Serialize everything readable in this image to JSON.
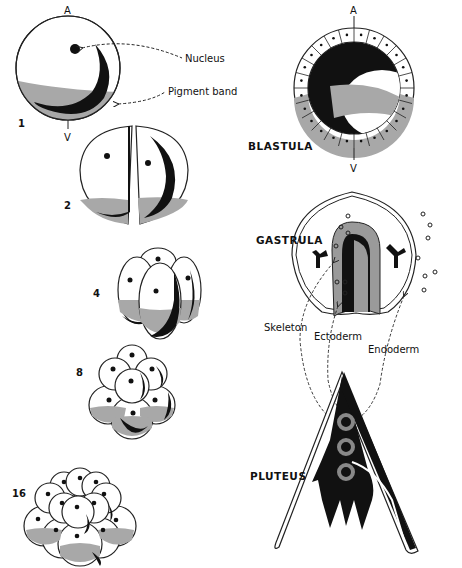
{
  "diagram": {
    "colors": {
      "pigment_gray": "#a8a8a8",
      "endoderm_gray": "#9a9a9a",
      "dark": "#111111",
      "outline": "#222222"
    },
    "cleavage_stages": [
      {
        "label": "1",
        "cells": 1
      },
      {
        "label": "2",
        "cells": 2
      },
      {
        "label": "4",
        "cells": 4
      },
      {
        "label": "8",
        "cells": 8
      },
      {
        "label": "16",
        "cells": 16
      }
    ],
    "pole_labels": {
      "animal": "A",
      "vegetal": "V"
    },
    "annotations": {
      "nucleus": "Nucleus",
      "pigment_band": "Pigment band",
      "skeleton": "Skeleton",
      "ectoderm": "Ectoderm",
      "endoderm": "Endoderm"
    },
    "stage_names": {
      "blastula": "BLASTULA",
      "gastrula": "GASTRULA",
      "pluteus": "PLUTEUS"
    }
  }
}
